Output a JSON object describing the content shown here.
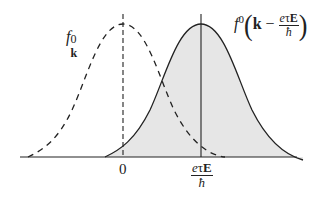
{
  "figure": {
    "type": "distribution-shift-diagram",
    "colors": {
      "line": "#222222",
      "fill": "#e6e6e6",
      "background": "#ffffff"
    },
    "curves": [
      {
        "name": "equilibrium-distribution",
        "style": "dashed",
        "center_label": "0"
      },
      {
        "name": "shifted-distribution",
        "style": "solid",
        "filled": true,
        "center_label": "eτE/ħ"
      }
    ]
  },
  "labels": {
    "left_curve": {
      "f": "f",
      "sub": "k",
      "sup": "0"
    },
    "right_curve": {
      "f": "f",
      "sup": "0",
      "k": "k",
      "minus": " − ",
      "num_e": "e",
      "num_tau": "τ",
      "num_E": "E",
      "den": "ħ"
    },
    "axis": {
      "tick_zero": "0",
      "tick_shift": {
        "num_e": "e",
        "num_tau": "τ",
        "num_E": "E",
        "den": "ħ"
      }
    }
  }
}
